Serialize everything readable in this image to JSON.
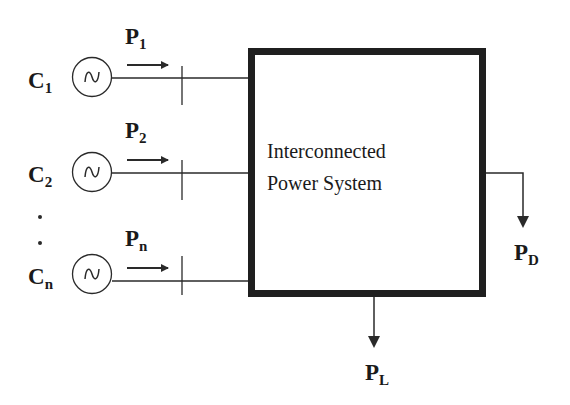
{
  "diagram": {
    "box": {
      "line1": "Interconnected",
      "line2": "Power System"
    },
    "generators": [
      {
        "label": "C",
        "label_sub": "1",
        "power": "P",
        "power_sub": "1",
        "symbol": "sine-wave-icon"
      },
      {
        "label": "C",
        "label_sub": "2",
        "power": "P",
        "power_sub": "2",
        "symbol": "sine-wave-icon"
      },
      {
        "label": "C",
        "label_sub": "n",
        "power": "P",
        "power_sub": "n",
        "symbol": "sine-wave-icon"
      }
    ],
    "ellipsis": ".",
    "outputs": {
      "demand": {
        "label": "P",
        "sub": "D"
      },
      "loss": {
        "label": "P",
        "sub": "L"
      }
    },
    "colors": {
      "stroke": "#2a2a2a",
      "box_border": "#1f1f1f",
      "background": "#ffffff"
    }
  }
}
